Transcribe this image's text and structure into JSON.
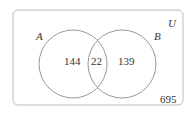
{
  "diagram": {
    "type": "venn",
    "universe_label": "U",
    "sets": [
      {
        "label": "A",
        "only_count": "144"
      },
      {
        "label": "B",
        "only_count": "139"
      }
    ],
    "intersection_count": "22",
    "outside_count": "695",
    "colors": {
      "stroke": "#999999",
      "text": "#333333"
    }
  }
}
